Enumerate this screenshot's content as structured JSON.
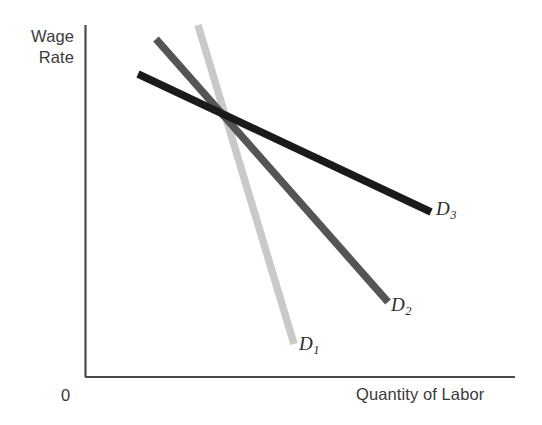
{
  "figure": {
    "background_color": "#ffffff",
    "axis_color": "#4a4a4a",
    "origin_label": "0"
  },
  "axes": {
    "y_title_line1": "Wage",
    "y_title_line2": "Rate",
    "x_title": "Quantity of Labor"
  },
  "curves": [
    {
      "id": "D1",
      "label_letter": "D",
      "label_sub": "1",
      "color": "#c9c9c9"
    },
    {
      "id": "D2",
      "label_letter": "D",
      "label_sub": "2",
      "color": "#555555"
    },
    {
      "id": "D3",
      "label_letter": "D",
      "label_sub": "3",
      "color": "#1a1a1a"
    }
  ],
  "chart_data": {
    "type": "line",
    "title": "",
    "subtitle": "",
    "xlabel": "Quantity of Labor",
    "ylabel": "Wage Rate",
    "grid": false,
    "legend_position": "inline-end-of-line",
    "axis_origin_label": "0",
    "xlim": [
      0,
      100
    ],
    "ylim": [
      0,
      100
    ],
    "axis_ticks": {
      "x": [],
      "y": []
    },
    "note": "Three downward-sloping labor demand curves of differing elasticity, all crossing at a common point. D1 is steepest (least elastic), D3 is flattest (most elastic).",
    "series": [
      {
        "name": "D1",
        "label": "D1",
        "color": "#c9c9c9",
        "elasticity": "least elastic (steepest)",
        "points": [
          {
            "x": 26.3,
            "y": 100.0
          },
          {
            "x": 48.6,
            "y": 9.4
          }
        ]
      },
      {
        "name": "D2",
        "label": "D2",
        "color": "#555555",
        "elasticity": "intermediate",
        "points": [
          {
            "x": 16.5,
            "y": 96.0
          },
          {
            "x": 70.4,
            "y": 21.3
          }
        ]
      },
      {
        "name": "D3",
        "label": "D3",
        "color": "#1a1a1a",
        "elasticity": "most elastic (flattest)",
        "points": [
          {
            "x": 12.4,
            "y": 86.1
          },
          {
            "x": 80.4,
            "y": 46.9
          }
        ]
      }
    ],
    "intersection_point": {
      "x": 32.7,
      "y": 73.0
    },
    "annotations": [
      {
        "text": "D1",
        "attached_to": "D1",
        "position": "below-right of curve end"
      },
      {
        "text": "D2",
        "attached_to": "D2",
        "position": "below-right of curve end"
      },
      {
        "text": "D3",
        "attached_to": "D3",
        "position": "right of curve end"
      }
    ]
  },
  "geometry": {
    "plot_left": 85,
    "plot_right": 515,
    "plot_top": 25,
    "plot_bottom": 377,
    "lines": [
      {
        "id": "D1",
        "x1": 198,
        "y1": 25,
        "x2": 294,
        "y2": 344,
        "width": 7.5,
        "color": "#c9c9c9"
      },
      {
        "id": "D2",
        "x1": 156,
        "y1": 39,
        "x2": 388,
        "y2": 302,
        "width": 7.5,
        "color": "#555555"
      },
      {
        "id": "D3",
        "x1": 138,
        "y1": 74,
        "x2": 431,
        "y2": 212,
        "width": 7.5,
        "color": "#1a1a1a"
      }
    ]
  }
}
